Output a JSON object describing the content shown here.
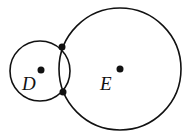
{
  "diagram": {
    "circles": [
      {
        "name": "D",
        "cx": 40,
        "cy": 71,
        "r": 30
      },
      {
        "name": "E",
        "cx": 120,
        "cy": 69,
        "r": 61
      }
    ],
    "points": [
      {
        "name": "center-D",
        "x": 41,
        "y": 70
      },
      {
        "name": "center-E",
        "x": 120,
        "y": 69
      },
      {
        "name": "intersection-top",
        "x": 62,
        "y": 47
      },
      {
        "name": "intersection-bottom",
        "x": 63,
        "y": 92
      }
    ],
    "labels": {
      "D": "D",
      "E": "E"
    },
    "stroke_color": "#111111"
  }
}
